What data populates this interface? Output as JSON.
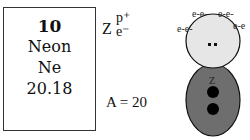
{
  "element_card": {
    "atomic_number": "10",
    "name": "Neon",
    "symbol": "Ne",
    "atomic_mass": "20.18"
  },
  "legend": {
    "z_label": "Z",
    "proton_label": "p⁺",
    "electron_label": "e⁻",
    "mass_number": "A = 20"
  },
  "model": {
    "electron_labels": [
      "e-e-",
      "e-e-",
      "e-e-",
      "e-e"
    ],
    "core_label": "Z",
    "colors": {
      "cloud": "#e6e6e6",
      "nucleus": "#6e6e6e",
      "dot": "#000000",
      "outline": "#111111"
    }
  }
}
